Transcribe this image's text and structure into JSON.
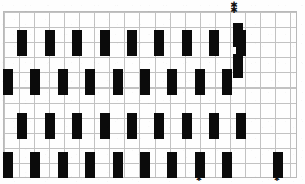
{
  "figure": {
    "background_color": "#fefefe",
    "mark_color": "#0b0b0b",
    "grid_color": "#c2c2c2",
    "grid_border_color": "#b9b9b9",
    "width": 305,
    "height": 184,
    "grid": {
      "left": 3,
      "top": 11,
      "width": 294,
      "height": 167,
      "cell_width": 15.05,
      "cell_height": 15.1,
      "columns": 19,
      "rows": 11
    }
  },
  "chart_data": {
    "type": "heatmap",
    "xlabel": "",
    "ylabel": "",
    "grid": true,
    "legend_position": "none",
    "rows": [
      {
        "name": "row-1",
        "y": 30,
        "height": 26,
        "bar_width": 10,
        "count": 9,
        "x_positions": [
          17,
          45,
          72,
          100,
          127,
          154,
          182,
          209,
          236
        ]
      },
      {
        "name": "row-2",
        "y": 69,
        "height": 26,
        "bar_width": 10,
        "count": 9,
        "x_positions": [
          3,
          30,
          58,
          85,
          113,
          140,
          167,
          195,
          222
        ]
      },
      {
        "name": "row-3",
        "y": 113,
        "height": 26,
        "bar_width": 10,
        "count": 9,
        "x_positions": [
          17,
          45,
          72,
          100,
          127,
          154,
          182,
          209,
          236
        ]
      },
      {
        "name": "row-4",
        "y": 152,
        "height": 26,
        "bar_width": 10,
        "count": 9,
        "x_positions": [
          3,
          30,
          58,
          85,
          113,
          140,
          167,
          195,
          222
        ]
      }
    ],
    "extra_marks": [
      {
        "name": "tall-mark-upper",
        "x": 233,
        "y": 23,
        "width": 10,
        "height": 24
      },
      {
        "name": "tall-mark-lower",
        "x": 233,
        "y": 54,
        "width": 10,
        "height": 24
      },
      {
        "name": "row-4-isolated-a",
        "x": 195,
        "y": 152,
        "width": 10,
        "height": 26
      },
      {
        "name": "row-4-isolated-b",
        "x": 273,
        "y": 152,
        "width": 10,
        "height": 26
      }
    ],
    "annotations": [
      {
        "name": "asterisk-top-1",
        "glyph": "✱",
        "x": 234,
        "y": 1
      },
      {
        "name": "asterisk-top-2",
        "glyph": "✱",
        "x": 234,
        "y": 6
      },
      {
        "name": "asterisk-bottom-1",
        "glyph": "✱",
        "x": 199,
        "y": 176
      },
      {
        "name": "asterisk-bottom-2",
        "glyph": "✱",
        "x": 277,
        "y": 176
      }
    ]
  }
}
